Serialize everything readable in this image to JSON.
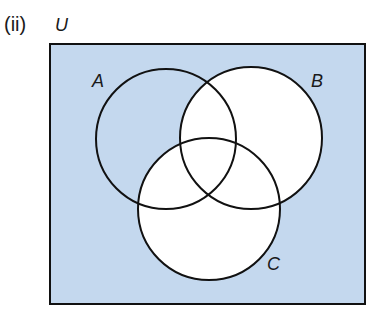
{
  "part_label": "(ii)",
  "universal_set": {
    "label": "U"
  },
  "sets": [
    {
      "id": "A",
      "label": "A"
    },
    {
      "id": "B",
      "label": "B"
    },
    {
      "id": "C",
      "label": "C"
    }
  ],
  "shaded_region": "A ∩ B' ∩ C' together with (A ∪ B ∪ C)'",
  "colors": {
    "shade": "#c4d8ee",
    "unshaded": "#ffffff",
    "outline": "#111111"
  }
}
